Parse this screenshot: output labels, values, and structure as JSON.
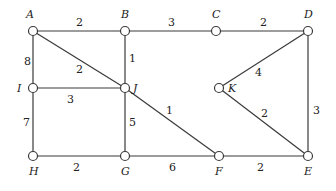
{
  "graph": {
    "nodes": [
      {
        "id": "A",
        "x": 33,
        "y": 31,
        "lx": 26,
        "ly": 18
      },
      {
        "id": "B",
        "x": 125,
        "y": 31,
        "lx": 121,
        "ly": 18
      },
      {
        "id": "C",
        "x": 216,
        "y": 31,
        "lx": 212,
        "ly": 18
      },
      {
        "id": "D",
        "x": 308,
        "y": 31,
        "lx": 304,
        "ly": 18
      },
      {
        "id": "I",
        "x": 33,
        "y": 88,
        "lx": 17,
        "ly": 92
      },
      {
        "id": "J",
        "x": 125,
        "y": 88,
        "lx": 133,
        "ly": 92
      },
      {
        "id": "K",
        "x": 219,
        "y": 88,
        "lx": 228,
        "ly": 92
      },
      {
        "id": "H",
        "x": 33,
        "y": 156,
        "lx": 29,
        "ly": 175
      },
      {
        "id": "G",
        "x": 125,
        "y": 156,
        "lx": 121,
        "ly": 175
      },
      {
        "id": "F",
        "x": 219,
        "y": 156,
        "lx": 215,
        "ly": 175
      },
      {
        "id": "E",
        "x": 308,
        "y": 156,
        "lx": 304,
        "ly": 175
      }
    ],
    "edges": [
      {
        "from": "A",
        "to": "B",
        "w": "2",
        "lx": 76,
        "ly": 26
      },
      {
        "from": "B",
        "to": "C",
        "w": "3",
        "lx": 168,
        "ly": 26
      },
      {
        "from": "C",
        "to": "D",
        "w": "2",
        "lx": 260,
        "ly": 26
      },
      {
        "from": "A",
        "to": "I",
        "w": "8",
        "lx": 24,
        "ly": 65
      },
      {
        "from": "A",
        "to": "J",
        "w": "2",
        "lx": 76,
        "ly": 73
      },
      {
        "from": "B",
        "to": "J",
        "w": "1",
        "lx": 129,
        "ly": 62
      },
      {
        "from": "I",
        "to": "J",
        "w": "3",
        "lx": 67,
        "ly": 103
      },
      {
        "from": "D",
        "to": "K",
        "w": "4",
        "lx": 255,
        "ly": 76
      },
      {
        "from": "D",
        "to": "E",
        "w": "3",
        "lx": 313,
        "ly": 114
      },
      {
        "from": "J",
        "to": "F",
        "w": "1",
        "lx": 166,
        "ly": 114
      },
      {
        "from": "J",
        "to": "G",
        "w": "5",
        "lx": 129,
        "ly": 126
      },
      {
        "from": "I",
        "to": "H",
        "w": "7",
        "lx": 23,
        "ly": 126
      },
      {
        "from": "K",
        "to": "E",
        "w": "2",
        "lx": 261,
        "ly": 117
      },
      {
        "from": "H",
        "to": "G",
        "w": "2",
        "lx": 73,
        "ly": 171
      },
      {
        "from": "G",
        "to": "F",
        "w": "6",
        "lx": 169,
        "ly": 171
      },
      {
        "from": "F",
        "to": "E",
        "w": "2",
        "lx": 257,
        "ly": 171
      }
    ]
  }
}
